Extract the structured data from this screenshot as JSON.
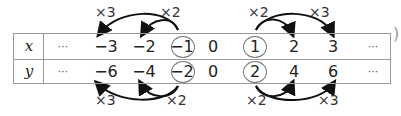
{
  "table": {
    "rows": [
      {
        "var": "x",
        "cells": [
          "···",
          "−3",
          "−2",
          "−1",
          "0",
          "1",
          "2",
          "3",
          "···"
        ]
      },
      {
        "var": "y",
        "cells": [
          "···",
          "−6",
          "−4",
          "−2",
          "0",
          "2",
          "4",
          "6",
          "···"
        ]
      }
    ],
    "circled": [
      "−1",
      "1",
      "−2",
      "2"
    ]
  },
  "annotations": {
    "top_left_x3": "×3",
    "top_left_x2": "×2",
    "top_right_x2": "×2",
    "top_right_x3": "×3",
    "bottom_left_x3": "×3",
    "bottom_left_x2": "×2",
    "bottom_right_x2": "×2",
    "bottom_right_x3": "×3"
  },
  "edge_mark": ")"
}
